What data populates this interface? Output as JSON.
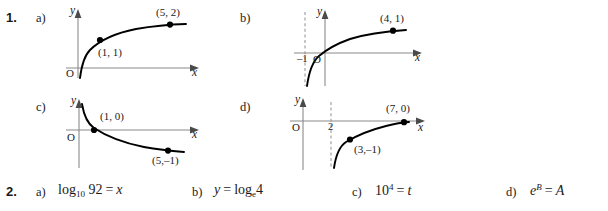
{
  "exercise1": {
    "number": "1.",
    "parts": [
      {
        "letter": "a)",
        "graph": {
          "y_axis_label": "y",
          "x_axis_label": "x",
          "origin_label": "O",
          "points": [
            {
              "label": "(1, 1)",
              "x": 1,
              "y": 1
            },
            {
              "label": "(5, 2)",
              "x": 5,
              "y": 2
            }
          ],
          "asymptote": null,
          "asymptote_tick": null,
          "curve_type": "increasing-logarithmic"
        }
      },
      {
        "letter": "b)",
        "graph": {
          "y_axis_label": "y",
          "x_axis_label": "x",
          "origin_label": "O",
          "points": [
            {
              "label": "(4, 1)",
              "x": 4,
              "y": 1
            }
          ],
          "asymptote": "x = -1",
          "asymptote_tick": "–1",
          "curve_type": "increasing-logarithmic-shifted"
        }
      },
      {
        "letter": "c)",
        "graph": {
          "y_axis_label": "y",
          "x_axis_label": "x",
          "origin_label": "O",
          "points": [
            {
              "label": "(1, 0)",
              "x": 1,
              "y": 0
            },
            {
              "label": "(5,–1)",
              "x": 5,
              "y": -1
            }
          ],
          "asymptote": null,
          "asymptote_tick": null,
          "curve_type": "decreasing-logarithmic"
        }
      },
      {
        "letter": "d)",
        "graph": {
          "y_axis_label": "y",
          "x_axis_label": "x",
          "origin_label": "O",
          "points": [
            {
              "label": "(3,–1)",
              "x": 3,
              "y": -1
            },
            {
              "label": "(7, 0)",
              "x": 7,
              "y": 0
            }
          ],
          "asymptote": "x = 2",
          "asymptote_tick": "2",
          "curve_type": "increasing-logarithmic-shifted"
        }
      }
    ]
  },
  "exercise2": {
    "number": "2.",
    "parts": [
      {
        "letter": "a)",
        "equation": "log₁₀ 92 = x",
        "base": "10",
        "argument": "92",
        "result": "x"
      },
      {
        "letter": "b)",
        "equation": "y = logₑ 4",
        "base": "e",
        "argument": "4",
        "result": "y"
      },
      {
        "letter": "c)",
        "equation": "10⁴ = t",
        "base": "10",
        "exponent": "4",
        "result": "t"
      },
      {
        "letter": "d)",
        "equation": "eᴮ = A",
        "base": "e",
        "exponent": "B",
        "result": "A"
      }
    ]
  },
  "colors": {
    "ink": "#1a1a1a",
    "axis": "#8a8a8a",
    "curve": "#000000",
    "dashed": "#9a9a9a",
    "background": "#ffffff"
  }
}
